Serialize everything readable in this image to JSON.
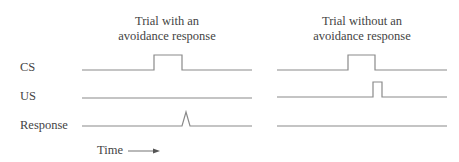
{
  "panels": [
    {
      "title_line1": "Trial with an",
      "title_line2": "avoidance response"
    },
    {
      "title_line1": "Trial without an",
      "title_line2": "avoidance response"
    }
  ],
  "rows": [
    {
      "label": "CS"
    },
    {
      "label": "US"
    },
    {
      "label": "Response"
    }
  ],
  "axis": {
    "time_label": "Time"
  },
  "colors": {
    "line": "#8a8a8a",
    "text": "#444444"
  }
}
